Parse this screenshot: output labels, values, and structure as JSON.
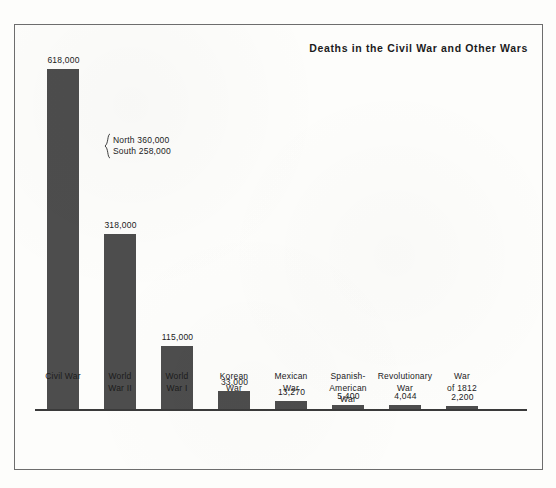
{
  "chart_data": {
    "type": "bar",
    "title": "Deaths in the Civil War and Other Wars",
    "xlabel": "",
    "ylabel": "",
    "ylim": [
      0,
      618000
    ],
    "grid": false,
    "legend": "none",
    "orientation": "vertical",
    "bar_color": "#4d4d4d",
    "categories": [
      "Civil War",
      "World War II",
      "World War I",
      "Korean War",
      "Mexican War",
      "Spanish-American War",
      "Revolutionary War",
      "War of 1812"
    ],
    "values": [
      618000,
      318000,
      115000,
      33000,
      13270,
      5400,
      4044,
      2200
    ],
    "value_labels": [
      "618,000",
      "318,000",
      "115,000",
      "33,000",
      "13,270",
      "5,400",
      "4,044",
      "2,200"
    ],
    "annotations": [
      {
        "target": "Civil War",
        "label": "brace-breakdown",
        "lines": [
          "North 360,000",
          "South 258,000"
        ],
        "parts": [
          {
            "name": "North",
            "value": 360000,
            "text": "North 360,000"
          },
          {
            "name": "South",
            "value": 258000,
            "text": "South 258,000"
          }
        ]
      }
    ]
  },
  "chart": {
    "title": "Deaths in the Civil War and Other Wars",
    "bars": [
      {
        "category_lines": [
          "Civil War"
        ],
        "value_label": "618,000",
        "bar_height_px": 340
      },
      {
        "category_lines": [
          "World",
          "War II"
        ],
        "value_label": "318,000",
        "bar_height_px": 175
      },
      {
        "category_lines": [
          "World",
          "War I"
        ],
        "value_label": "115,000",
        "bar_height_px": 63
      },
      {
        "category_lines": [
          "Korean",
          "War"
        ],
        "value_label": "33,000",
        "bar_height_px": 18
      },
      {
        "category_lines": [
          "Mexican",
          "War"
        ],
        "value_label": "13,270",
        "bar_height_px": 8
      },
      {
        "category_lines": [
          "Spanish-",
          "American",
          "War"
        ],
        "value_label": "5,400",
        "bar_height_px": 4
      },
      {
        "category_lines": [
          "Revolutionary",
          "War"
        ],
        "value_label": "4,044",
        "bar_height_px": 4
      },
      {
        "category_lines": [
          "War",
          "of 1812"
        ],
        "value_label": "2,200",
        "bar_height_px": 3
      }
    ],
    "annotation": {
      "line1": "North 360,000",
      "line2": "South 258,000"
    }
  }
}
